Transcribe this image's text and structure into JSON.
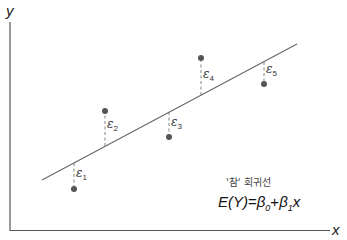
{
  "diagram": {
    "type": "simple linear regression true line with errors",
    "axes": {
      "x_label": "x",
      "y_label": "y"
    },
    "regression_line": {
      "caption": "'참' 회귀선",
      "formula": {
        "lhs": "E(Y)",
        "eq": "=",
        "b0": "β",
        "b0_sub": "0",
        "plus": "+",
        "b1": "β",
        "b1_sub": "1",
        "x": "x"
      }
    },
    "errors": [
      {
        "symbol": "ε",
        "sub": "1"
      },
      {
        "symbol": "ε",
        "sub": "2"
      },
      {
        "symbol": "ε",
        "sub": "3"
      },
      {
        "symbol": "ε",
        "sub": "4"
      },
      {
        "symbol": "ε",
        "sub": "5"
      }
    ],
    "colors": {
      "axis": "#555555",
      "line": "#666666",
      "point": "#555555",
      "residual": "#777777"
    }
  }
}
